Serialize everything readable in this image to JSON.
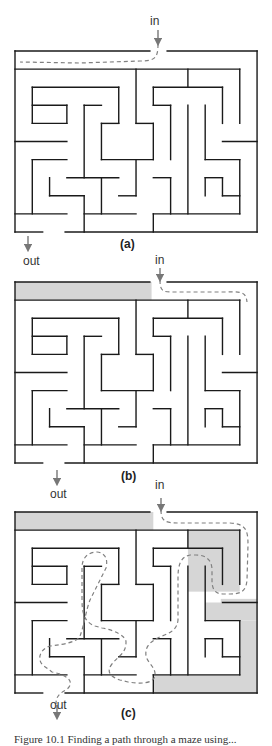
{
  "figure": {
    "caption": "Figure 10.1  Finding a path through a maze using...",
    "grid": {
      "cols": 14,
      "rows": 10,
      "cell_w": 17.29,
      "cell_h": 18.1
    },
    "colors": {
      "wall": "#1a1a1a",
      "shade": "#d6d6d6",
      "path": "#808080",
      "arrow": "#777777"
    },
    "walls": [
      [
        0,
        0,
        7.8,
        0
      ],
      [
        8.8,
        0,
        14,
        0
      ],
      [
        0,
        0,
        0,
        10
      ],
      [
        14,
        0,
        14,
        10
      ],
      [
        0,
        10,
        1.6,
        10
      ],
      [
        2.9,
        10,
        14,
        10
      ],
      [
        0,
        1,
        13,
        1
      ],
      [
        1,
        2,
        6,
        2
      ],
      [
        1,
        2,
        1,
        4
      ],
      [
        1,
        4,
        3,
        4
      ],
      [
        1,
        3,
        3,
        3
      ],
      [
        3,
        3,
        3,
        4
      ],
      [
        6,
        2,
        6,
        4
      ],
      [
        5,
        4,
        6,
        4
      ],
      [
        5,
        4,
        5,
        6
      ],
      [
        5,
        6,
        8,
        6
      ],
      [
        4,
        3,
        5,
        3
      ],
      [
        4,
        3,
        4,
        7
      ],
      [
        7,
        1,
        7,
        4
      ],
      [
        7,
        4,
        8,
        4
      ],
      [
        8,
        4,
        8,
        6
      ],
      [
        7,
        6,
        7,
        8
      ],
      [
        6,
        8,
        7,
        8
      ],
      [
        0,
        5,
        3,
        5
      ],
      [
        1,
        6,
        3,
        6
      ],
      [
        1,
        6,
        1,
        9
      ],
      [
        0,
        9,
        3,
        9
      ],
      [
        2,
        7,
        2,
        8
      ],
      [
        2,
        8,
        4,
        8
      ],
      [
        4,
        8,
        4,
        10
      ],
      [
        3,
        7,
        6,
        7
      ],
      [
        5,
        7,
        5,
        9
      ],
      [
        4,
        9,
        7,
        9
      ],
      [
        8,
        7,
        9,
        7
      ],
      [
        9,
        7,
        9,
        9
      ],
      [
        8,
        9,
        13,
        9
      ],
      [
        8,
        9,
        8,
        10
      ],
      [
        10,
        1,
        10,
        2
      ],
      [
        8,
        2,
        12,
        2
      ],
      [
        8,
        2,
        8,
        3
      ],
      [
        8,
        3,
        9,
        3
      ],
      [
        9,
        3,
        9,
        6
      ],
      [
        10,
        3,
        10,
        9
      ],
      [
        11,
        3,
        11,
        6
      ],
      [
        11,
        6,
        13,
        6
      ],
      [
        13,
        6,
        13,
        9
      ],
      [
        12,
        2,
        12,
        4
      ],
      [
        13,
        1,
        13,
        4
      ],
      [
        12,
        5,
        14,
        5
      ],
      [
        11,
        7,
        12,
        7
      ],
      [
        11,
        7,
        11,
        8
      ],
      [
        12,
        7,
        12,
        8
      ],
      [
        12,
        8,
        13,
        8
      ]
    ],
    "panels": [
      {
        "id": "a",
        "label": "(a)",
        "origin": [
          15,
          51
        ],
        "in_label": "in",
        "out_label": "out",
        "in_label_pos": [
          150,
          14
        ],
        "in_arrow": [
          158,
          30,
          158,
          42
        ],
        "out_label_pos": [
          23,
          254
        ],
        "out_arrow": [
          28,
          236,
          28,
          248
        ],
        "panel_label_pos": [
          120,
          237
        ],
        "shaded": [],
        "path": "M158,44 C158,58 155,61 140,61 L80,63 L20,62"
      },
      {
        "id": "b",
        "label": "(b)",
        "origin": [
          15,
          282
        ],
        "in_label": "in",
        "out_label": "out",
        "in_label_pos": [
          155,
          253
        ],
        "in_arrow": [
          160,
          268,
          160,
          278
        ],
        "out_label_pos": [
          50,
          487
        ],
        "out_arrow": [
          57,
          470,
          57,
          482
        ],
        "panel_label_pos": [
          121,
          469
        ],
        "shaded": [
          [
            0,
            0,
            7.9,
            1
          ]
        ],
        "path": "M160,280 C160,292 163,292 175,292 L228,292 C244,291 246,294 247,302"
      },
      {
        "id": "c",
        "label": "(c)",
        "origin": [
          15,
          512
        ],
        "in_label": "in",
        "out_label": "out",
        "in_label_pos": [
          155,
          478
        ],
        "in_arrow": [
          161,
          498,
          161,
          508
        ],
        "out_label_pos": [
          50,
          698
        ],
        "out_arrow": [
          57,
          705,
          57,
          716
        ],
        "panel_label_pos": [
          121,
          706
        ],
        "shaded": [
          [
            0,
            0,
            8,
            1
          ],
          [
            10,
            1,
            13,
            4.4
          ],
          [
            11.9,
            4.8,
            14,
            5
          ],
          [
            11,
            5,
            14,
            6
          ],
          [
            13,
            6,
            14,
            10
          ],
          [
            8,
            9,
            14,
            10
          ]
        ],
        "path": "M161,510 C161,522 166,523 180,523 L230,523 C246,524 248,530 248,545 L247,580 C246,592 240,594 230,594 L223,594 C214,594 212,588 212,580 L212,570 C212,560 206,555 196,555 L190,555 C180,557 178,566 178,578 L178,620 C177,630 170,633 162,636 C148,642 145,648 146,656 C148,664 156,667 155,676 C153,684 140,684 128,682 L120,680 C108,676 107,670 112,664 C118,656 126,654 126,642 C126,636 114,630 102,628 L95,626 C84,622 82,612 82,600 L82,568 C82,556 90,552 97,552 C106,553 108,560 106,568 L90,600 C86,610 84,626 80,636 C77,642 66,644 50,646 C40,649 36,660 44,666 L52,672 C72,676 74,684 66,690 C58,694 56,698 56,704"
      }
    ]
  }
}
